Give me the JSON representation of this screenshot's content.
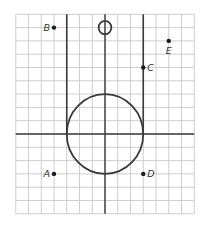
{
  "figure": {
    "grid": {
      "x_min": -7,
      "x_max": 7,
      "y_min": -6,
      "y_max": 9,
      "step": 1
    },
    "colors": {
      "grid": "#c8c8c8",
      "ink": "#3a3a3a",
      "point": "#1a1a1a",
      "background": "#ffffff"
    },
    "shapes": [
      {
        "type": "circle",
        "name": "large-circle",
        "center": [
          0,
          0
        ],
        "radius": 3
      },
      {
        "type": "circle",
        "name": "small-circle",
        "center": [
          0,
          8
        ],
        "radius": 0.5
      },
      {
        "type": "segment",
        "name": "left-vertical-line",
        "from": [
          -3,
          9
        ],
        "to": [
          -3,
          0
        ]
      },
      {
        "type": "segment",
        "name": "right-vertical-line",
        "from": [
          3,
          9
        ],
        "to": [
          3,
          0
        ]
      }
    ],
    "points": [
      {
        "label": "A",
        "x": -4,
        "y": -3,
        "label_pos": "left"
      },
      {
        "label": "B",
        "x": -4,
        "y": 8,
        "label_pos": "left"
      },
      {
        "label": "C",
        "x": 3,
        "y": 5,
        "label_pos": "right"
      },
      {
        "label": "D",
        "x": 3,
        "y": -3,
        "label_pos": "right"
      },
      {
        "label": "E",
        "x": 5,
        "y": 7,
        "label_pos": "below"
      }
    ]
  }
}
